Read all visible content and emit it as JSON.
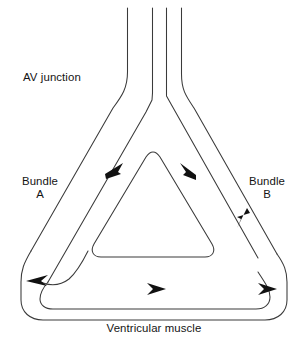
{
  "figure": {
    "type": "diagram",
    "background_color": "#ffffff",
    "line_color": "#3a3a3a",
    "arrow_color": "#111111",
    "labels": {
      "av_junction": "AV junction",
      "bundle_a": "Bundle\nA",
      "bundle_b": "Bundle\nB",
      "ventricular_muscle": "Ventricular muscle"
    },
    "flow_arrows": [
      {
        "name": "antegrade-left-limb",
        "direction": "down-left",
        "on": "bundle-a"
      },
      {
        "name": "antegrade-right-limb",
        "direction": "down-right",
        "on": "bundle-b-inner"
      },
      {
        "name": "left-turnaround",
        "direction": "left",
        "on": "bundle-a-terminal"
      },
      {
        "name": "ventricular-conduction",
        "direction": "right",
        "on": "ventricular-muscle"
      },
      {
        "name": "ventricular-exit",
        "direction": "right",
        "on": "ventricular-muscle-right"
      },
      {
        "name": "retrograde-right-limb",
        "direction": "up-right",
        "on": "bundle-b"
      }
    ],
    "conduction_paths": [
      {
        "name": "av-junction-trunk",
        "lines": 4
      },
      {
        "name": "bundle-a",
        "side": "left"
      },
      {
        "name": "bundle-b",
        "side": "right"
      },
      {
        "name": "ventricular-muscle-band",
        "side": "bottom"
      },
      {
        "name": "inner-triangular-loop",
        "shape": "rounded-triangle"
      }
    ]
  }
}
